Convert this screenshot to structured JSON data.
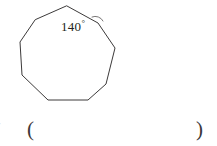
{
  "figure": {
    "shape_name": "nonagon",
    "sides": 9,
    "stroke_color": "#3c3a3a",
    "fill": "none",
    "vertices": [
      [
        67,
        6
      ],
      [
        98,
        23
      ],
      [
        115,
        48
      ],
      [
        106,
        84
      ],
      [
        88,
        100
      ],
      [
        48,
        100
      ],
      [
        22,
        75
      ],
      [
        20,
        42
      ],
      [
        35,
        20
      ]
    ],
    "angle_marker": {
      "name": "interior-angle-arc",
      "at_vertex": [
        98,
        23
      ],
      "path": "M 92 17 A 8.5 8.5 0 0 1 103 21",
      "stroke_color": "#6b6868"
    },
    "angle_label": {
      "value": "140",
      "degree_symbol": "°"
    }
  },
  "answer": {
    "open_paren": "(",
    "close_paren": ")",
    "value": ""
  },
  "artifacts": {
    "left_edge_mark": "·"
  }
}
